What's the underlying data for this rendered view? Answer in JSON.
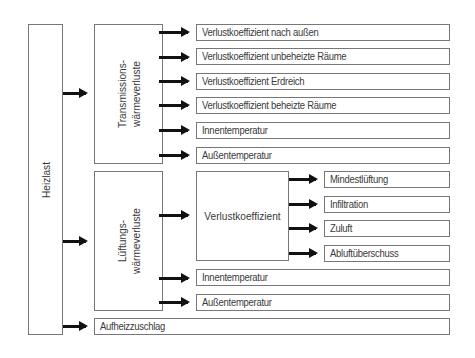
{
  "diagram": {
    "root": {
      "label": "Heizlast"
    },
    "groups": [
      {
        "label_line1": "Transmissions-",
        "label_line2": "wärmeverluste",
        "items": [
          "Verlustkoeffizient nach außen",
          "Verlustkoeffizient unbeheizte Räume",
          "Verlustkoeffizient Erdreich",
          "Verlustkoeffizient beheizte Räume",
          "Innentemperatur",
          "Außentemperatur"
        ]
      },
      {
        "label_line1": "Lüftungs-",
        "label_line2": "wärmeverluste",
        "sub_node": {
          "label": "Verlustkoeffizient",
          "items": [
            "Mindestlüftung",
            "Infiltration",
            "Zuluft",
            "Abluftüberschuss"
          ]
        },
        "items": [
          "Innentemperatur",
          "Außentemperatur"
        ]
      }
    ],
    "extra": {
      "label": "Aufheizzuschlag"
    }
  }
}
